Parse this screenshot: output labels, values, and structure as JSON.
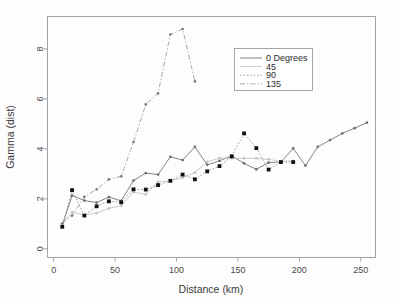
{
  "chart_data": {
    "type": "line",
    "title": "",
    "xlabel": "Distance (km)",
    "ylabel": "Gamma (dist)",
    "xlim": [
      -5,
      262
    ],
    "ylim": [
      -0.35,
      9.3
    ],
    "xticks": [
      0,
      50,
      100,
      150,
      200,
      250
    ],
    "yticks": [
      0,
      2,
      4,
      6,
      8
    ],
    "grid": false,
    "legend_position": "upper right",
    "legend_title": "",
    "series": [
      {
        "name": "0 Degrees",
        "color": "#6e6e6e",
        "linestyle": "solid",
        "marker": "dot",
        "marker_color": "#6e6e6e",
        "x": [
          7,
          15,
          25,
          35,
          45,
          55,
          65,
          75,
          85,
          95,
          105,
          115,
          125,
          135,
          145,
          155,
          165,
          175,
          185,
          195,
          205,
          215,
          225,
          235,
          245,
          255
        ],
        "y": [
          0.93,
          2.13,
          1.93,
          1.85,
          2.07,
          1.92,
          2.73,
          3.03,
          2.97,
          3.68,
          3.55,
          4.08,
          3.36,
          3.52,
          3.72,
          3.42,
          3.18,
          3.45,
          3.47,
          4.02,
          3.33,
          4.08,
          4.35,
          4.62,
          4.83,
          5.05
        ]
      },
      {
        "name": "45",
        "color": "#c2c2c2",
        "linestyle": "solid",
        "marker": "dot",
        "marker_color": "#c2c2c2",
        "x": [
          7,
          15,
          25,
          35,
          45,
          55,
          65,
          75,
          85,
          95,
          105,
          115,
          125,
          135,
          145,
          155,
          165,
          175,
          185,
          195
        ],
        "y": [
          0.97,
          1.47,
          1.35,
          1.43,
          1.62,
          1.72,
          2.27,
          2.18,
          2.68,
          2.72,
          2.85,
          3.05,
          3.48,
          3.63,
          3.62,
          3.62,
          3.62,
          3.58,
          3.5,
          3.52
        ]
      },
      {
        "name": "90",
        "color": "#8c8c8c",
        "linestyle": "dotted",
        "marker": "square",
        "marker_color": "#111111",
        "x": [
          7,
          15,
          25,
          35,
          45,
          55,
          65,
          75,
          85,
          95,
          105,
          115,
          125,
          135,
          145,
          155,
          165,
          175,
          185,
          195
        ],
        "y": [
          0.88,
          2.35,
          1.33,
          1.7,
          1.9,
          1.86,
          2.38,
          2.37,
          2.55,
          2.72,
          2.97,
          2.78,
          3.1,
          3.31,
          3.7,
          4.62,
          4.03,
          3.17,
          3.47,
          3.47
        ]
      },
      {
        "name": "135",
        "color": "#9b9b9b",
        "linestyle": "dashdot",
        "marker": "dot",
        "marker_color": "#7a7a7a",
        "x": [
          7,
          15,
          25,
          35,
          45,
          55,
          65,
          75,
          85,
          95,
          105,
          115
        ],
        "y": [
          1.02,
          1.33,
          2.08,
          2.38,
          2.78,
          2.9,
          4.27,
          5.78,
          6.22,
          8.58,
          8.8,
          6.7
        ]
      }
    ]
  },
  "legend": {
    "entries": [
      {
        "label": "0 Degrees"
      },
      {
        "label": "45"
      },
      {
        "label": "90"
      },
      {
        "label": "135"
      }
    ]
  }
}
